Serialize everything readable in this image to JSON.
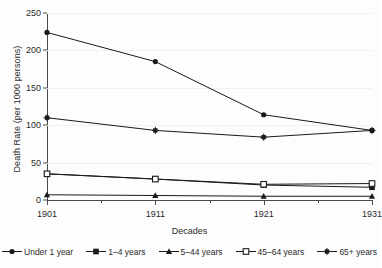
{
  "chart_data": {
    "type": "line",
    "title": "",
    "subtitle": "",
    "xlabel": "Decades",
    "ylabel": "Death Rate (per 1000 persons)",
    "categories": [
      "1901",
      "1911",
      "1921",
      "1931"
    ],
    "xlim": [
      0,
      3
    ],
    "ylim": [
      0,
      250
    ],
    "yticks": [
      0,
      50,
      100,
      150,
      200,
      250
    ],
    "grid": "horizontal",
    "legend_position": "bottom",
    "series": [
      {
        "name": "Under 1 year",
        "marker": "filled-circle",
        "color": "#1a1a1a",
        "values": [
          224,
          185,
          114,
          93
        ]
      },
      {
        "name": "1–4 years",
        "marker": "filled-square",
        "color": "#1a1a1a",
        "values": [
          35,
          28,
          20,
          17
        ]
      },
      {
        "name": "5–44 years",
        "marker": "filled-triangle",
        "color": "#1a1a1a",
        "values": [
          7,
          6,
          5,
          5
        ]
      },
      {
        "name": "45–64 years",
        "marker": "open-square",
        "color": "#1a1a1a",
        "values": [
          35,
          28,
          21,
          22
        ]
      },
      {
        "name": "65+ years",
        "marker": "filled-square-small",
        "color": "#1a1a1a",
        "values": [
          110,
          93,
          84,
          93
        ]
      }
    ]
  },
  "axes": {
    "y_title": "Death Rate (per 1000 persons)",
    "x_title": "Decades",
    "y_tick_labels": [
      "0",
      "50",
      "100",
      "150",
      "200",
      "250"
    ],
    "x_tick_labels": [
      "1901",
      "1911",
      "1921",
      "1931"
    ]
  },
  "legend": {
    "items": [
      {
        "label": "Under 1 year"
      },
      {
        "label": "1–4 years"
      },
      {
        "label": "5–44 years"
      },
      {
        "label": "45–64 years"
      },
      {
        "label": "65+ years"
      }
    ]
  },
  "style": {
    "line_color": "#1a1a1a",
    "axis_color": "#4a4a4a",
    "grid_color": "#f0f0f0",
    "background": "#fdfdfd"
  }
}
